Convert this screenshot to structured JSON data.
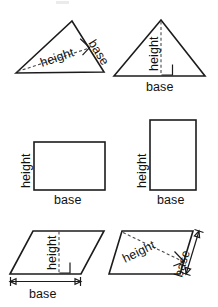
{
  "figure": {
    "stroke_color": "#1c1c1c",
    "dash_color": "#4a4a4a",
    "background": "#ffffff",
    "labels": {
      "base": "base",
      "height": "height"
    },
    "shapes": [
      {
        "id": "triangle-slanted-base",
        "type": "triangle",
        "position": "top-left",
        "base_label": "base",
        "height_label": "height",
        "base_side": "right-slanted-edge",
        "height_style": "dashed",
        "right_angle_marker": true
      },
      {
        "id": "triangle-horizontal-base",
        "type": "triangle",
        "position": "top-right",
        "base_label": "base",
        "height_label": "height",
        "base_side": "bottom-horizontal-edge",
        "height_style": "dashed-vertical",
        "right_angle_marker": true
      },
      {
        "id": "rectangle-wide",
        "type": "rectangle",
        "position": "middle-left",
        "base_label": "base",
        "height_label": "height",
        "orientation": "landscape"
      },
      {
        "id": "rectangle-tall",
        "type": "rectangle",
        "position": "middle-right",
        "base_label": "base",
        "height_label": "height",
        "orientation": "portrait"
      },
      {
        "id": "parallelogram-horizontal-base",
        "type": "parallelogram",
        "position": "bottom-left",
        "base_label": "base",
        "height_label": "height",
        "base_side": "bottom-horizontal-edge",
        "height_style": "dashed-vertical",
        "right_angle_marker": true,
        "dimension_arrow": true
      },
      {
        "id": "parallelogram-slanted-base",
        "type": "parallelogram",
        "position": "bottom-right",
        "base_label": "base",
        "height_label": "height",
        "base_side": "right-slanted-edge",
        "height_style": "dashed-diagonal",
        "right_angle_marker": true,
        "dimension_arrow": true
      }
    ]
  }
}
